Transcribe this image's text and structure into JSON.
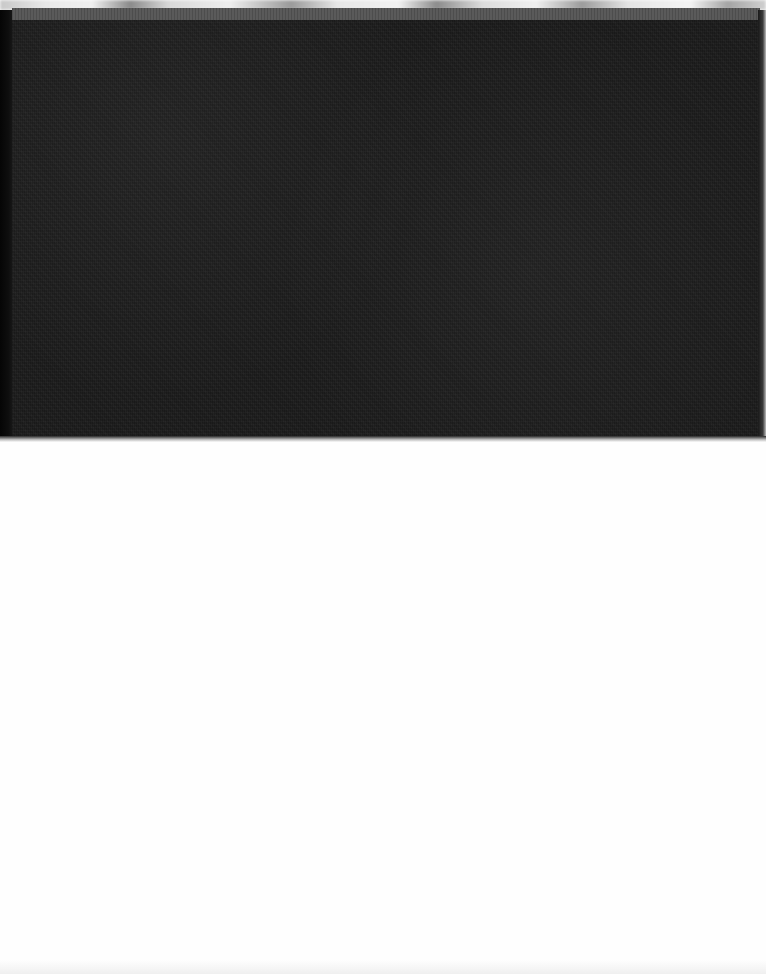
{
  "scene": {
    "description": "Photographic scan of a dark cloth book cover above a blank white page",
    "colors": {
      "cover": "#1e1e1e",
      "cover_top_band": "#5a5a5a",
      "page": "#fefefe",
      "top_strip": "#e8e8e8"
    }
  }
}
